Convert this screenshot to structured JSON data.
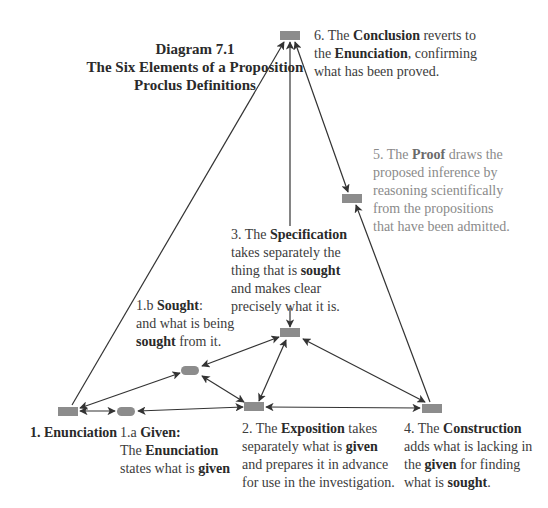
{
  "title": {
    "line1": "Diagram 7.1",
    "line2": "The Six Elements of a Proposition",
    "line3": "Proclus Definitions"
  },
  "nodes": [
    {
      "id": "n1",
      "label": "1. Enunciation",
      "shape": "rect"
    },
    {
      "id": "n1a",
      "label": "1.a Given",
      "shape": "pill"
    },
    {
      "id": "n1b",
      "label": "1.b Sought",
      "shape": "pill"
    },
    {
      "id": "n2",
      "label": "2. Exposition",
      "shape": "rect"
    },
    {
      "id": "n3",
      "label": "3. Specification",
      "shape": "rect"
    },
    {
      "id": "n4",
      "label": "4. Construction",
      "shape": "rect"
    },
    {
      "id": "n5",
      "label": "5. Proof",
      "shape": "rect"
    },
    {
      "id": "n6",
      "label": "6. Conclusion",
      "shape": "rect"
    }
  ],
  "edges": [
    {
      "from": "n1",
      "to": "n6",
      "direction": "to"
    },
    {
      "from": "n3",
      "to": "n6",
      "direction": "to"
    },
    {
      "from": "n6",
      "to": "n5",
      "direction": "both"
    },
    {
      "from": "n4",
      "to": "n5",
      "direction": "to"
    },
    {
      "from": "n3",
      "to": "n4",
      "direction": "both"
    },
    {
      "from": "n3",
      "to": "n1b",
      "direction": "both"
    },
    {
      "from": "n3",
      "to": "n2",
      "direction": "both"
    },
    {
      "from": "n1b",
      "to": "n2",
      "direction": "both"
    },
    {
      "from": "n1",
      "to": "n1b",
      "direction": "to"
    },
    {
      "from": "n1",
      "to": "n1a",
      "direction": "both"
    },
    {
      "from": "n1a",
      "to": "n2",
      "direction": "both"
    },
    {
      "from": "n2",
      "to": "n4",
      "direction": "both"
    }
  ],
  "labels": {
    "n6": {
      "l1_pre": "6. The ",
      "l1_bold": "Conclusion",
      "l1_post": " reverts to",
      "l2_pre": "the ",
      "l2_bold": "Enunciation",
      "l2_post": ", confirming",
      "l3": "what has been proved."
    },
    "n5": {
      "l1_pre": "5. The ",
      "l1_bold": "Proof",
      "l1_post": " draws the",
      "l2": "proposed inference by",
      "l3": "reasoning scientifically",
      "l4": "from the propositions",
      "l5": "that have been admitted."
    },
    "n3": {
      "l1_pre": "3. The ",
      "l1_bold": "Specification",
      "l2": "takes separately the",
      "l3_pre": "thing that is ",
      "l3_bold": "sought",
      "l4": "and makes clear",
      "l5": "precisely what it is."
    },
    "n1b": {
      "l1_pre": "1.b ",
      "l1_bold": "Sought",
      "l1_post": ":",
      "l2": "and what is being",
      "l3_bold": "sought",
      "l3_post": " from it."
    },
    "n1": {
      "l1_bold": "1. Enunciation"
    },
    "n1a": {
      "l1_pre": "1.a ",
      "l1_bold": "Given:",
      "l2_pre": "The ",
      "l2_bold": "Enunciation",
      "l3_pre": "states what is ",
      "l3_bold": "given"
    },
    "n2": {
      "l1_pre": "2. The ",
      "l1_bold": "Exposition",
      "l1_post": " takes",
      "l2_pre": "separately what is ",
      "l2_bold": "given",
      "l3": "and prepares it in advance",
      "l4": "for use in the investigation."
    },
    "n4": {
      "l1_pre": "4. The ",
      "l1_bold": "Construction",
      "l2": "adds what is lacking in",
      "l3_pre": "the ",
      "l3_bold": "given",
      "l3_post": " for finding",
      "l4_pre": "what is ",
      "l4_bold": "sought",
      "l4_post": "."
    }
  },
  "colors": {
    "node_fill": "#8c8c8c",
    "edge": "#333333",
    "text_dark": "#3c3c3c",
    "text_gray": "#8a8a8a"
  }
}
